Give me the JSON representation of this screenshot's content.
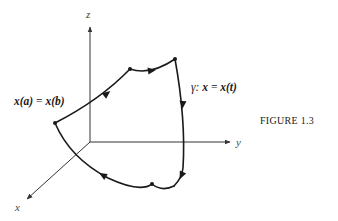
{
  "figure": {
    "caption": "FIGURE 1.3",
    "axes": {
      "x_label": "x",
      "y_label": "y",
      "z_label": "z"
    },
    "curve": {
      "name": "γ",
      "param_label_prefix": "γ:",
      "param_lhs": "x",
      "param_eq": "=",
      "param_rhs": "x(t)",
      "closed_point_lhs": "x(a)",
      "closed_point_eq": "=",
      "closed_point_rhs": "x(b)"
    },
    "colors": {
      "curve": "#1a1a1a",
      "axis": "#333333"
    }
  }
}
